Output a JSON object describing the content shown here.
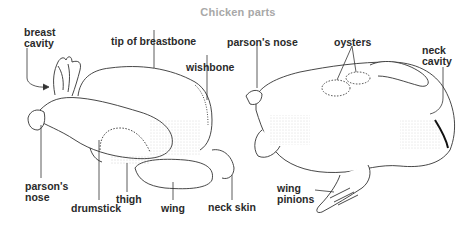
{
  "title": "Chicken parts",
  "left_view": {
    "labels": {
      "breast_cavity_1": "breast",
      "breast_cavity_2": "cavity",
      "tip_of_breastbone": "tip of breastbone",
      "wishbone": "wishbone",
      "parsons_nose_1": "parson's",
      "parsons_nose_2": "nose",
      "drumstick": "drumstick",
      "thigh": "thigh",
      "wing": "wing",
      "neck_skin": "neck skin"
    }
  },
  "right_view": {
    "labels": {
      "parsons_nose": "parson's nose",
      "oysters": "oysters",
      "neck_cavity_1": "neck",
      "neck_cavity_2": "cavity",
      "wing_pinions_1": "wing",
      "wing_pinions_2": "pinions"
    }
  },
  "colors": {
    "title": "#a8a8a8",
    "label": "#2a2a2a",
    "line": "#333333"
  }
}
